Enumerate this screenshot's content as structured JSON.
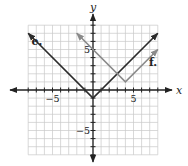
{
  "chart_data": {
    "type": "line",
    "title": "",
    "xlabel": "x",
    "ylabel": "y",
    "xlim": [
      -8,
      8
    ],
    "ylim": [
      -8,
      8
    ],
    "grid": true,
    "x_tick_labels": [
      {
        "value": -5,
        "label": "−5"
      },
      {
        "value": 5,
        "label": "5"
      }
    ],
    "y_tick_labels": [
      {
        "value": 5,
        "label": "5"
      },
      {
        "value": -5,
        "label": "−5"
      }
    ],
    "series": [
      {
        "name": "e.",
        "label": "e.",
        "color": "#2b2b2b",
        "equation_estimate": "y = |x| - 1",
        "points": [
          [
            -8,
            7
          ],
          [
            0,
            -1
          ],
          [
            8,
            7
          ]
        ],
        "label_pos": [
          -7.6,
          5.6
        ]
      },
      {
        "name": "f.",
        "label": "f.",
        "color": "#8a8a8a",
        "equation_estimate": "y = |x - 4| + 1",
        "points": [
          [
            -2,
            7
          ],
          [
            4,
            1
          ],
          [
            8,
            5
          ]
        ],
        "label_pos": [
          6.9,
          3.0
        ]
      }
    ]
  },
  "colors": {
    "grid": "#c8c8c8",
    "axis": "#222222"
  }
}
